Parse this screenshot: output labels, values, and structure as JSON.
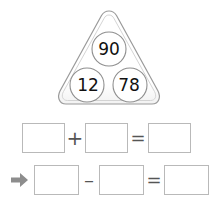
{
  "page": {
    "background_color": "#ffffff",
    "box_border_color": "#b9b9b9",
    "triangle_outline_color": "#9a9a9a",
    "arrow_color": "#8d8d8d",
    "number_color": "#111111"
  },
  "fact_triangle": {
    "name": "number-fact-triangle",
    "top_number": "90",
    "bottom_left_number": "12",
    "bottom_right_number": "78"
  },
  "equations": [
    {
      "id": "addition-row",
      "operator": "+",
      "equals": "=",
      "marker": "",
      "boxes": [
        {
          "name": "addend-1",
          "value": ""
        },
        {
          "name": "addend-2",
          "value": ""
        },
        {
          "name": "sum",
          "value": ""
        }
      ]
    },
    {
      "id": "subtraction-row",
      "operator": "–",
      "equals": "=",
      "marker": "arrow-right-icon",
      "boxes": [
        {
          "name": "minuend",
          "value": ""
        },
        {
          "name": "subtrahend",
          "value": ""
        },
        {
          "name": "difference",
          "value": ""
        }
      ]
    }
  ]
}
